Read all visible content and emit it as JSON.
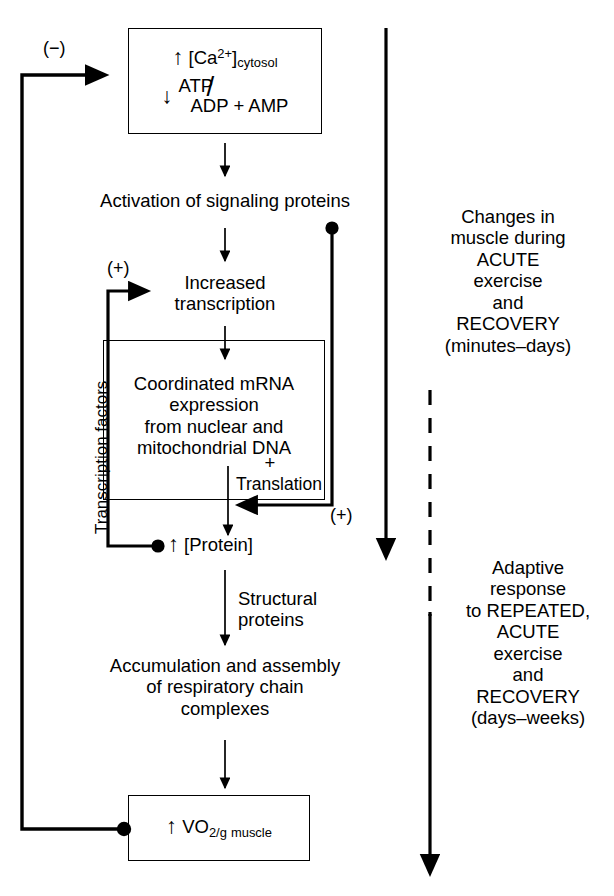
{
  "diagram": {
    "stroke_color": "#000000",
    "background": "#ffffff"
  },
  "nodes": {
    "stimulus_box": {
      "line1_arrow": "↑",
      "line1_species": "[Ca",
      "line1_charge": "2+",
      "line1_close": "]",
      "line1_subscript": "cytosol",
      "line2_arrow": "↓",
      "line2_numerator": "ATP",
      "line2_denominator": "ADP + AMP",
      "line2_slash": "/"
    },
    "activation": "Activation of signaling proteins",
    "increased_transcription": "Increased\ntranscription",
    "increased_transcription_l1": "Increased",
    "increased_transcription_l2": "transcription",
    "mrna_box_l1": "Coordinated mRNA",
    "mrna_box_l2": "expression",
    "mrna_box_l3": "from nuclear and",
    "mrna_box_l4": "mitochondrial DNA",
    "translation_plus": "+",
    "translation_label": "Translation",
    "protein": {
      "arrow": "↑",
      "label": "[Protein]"
    },
    "structural_proteins_l1": "Structural",
    "structural_proteins_l2": "proteins",
    "accumulation_l1": "Accumulation and assembly",
    "accumulation_l2": "of respiratory chain",
    "accumulation_l3": "complexes",
    "vo2_box": {
      "arrow": "↑",
      "label": "VO",
      "subscript": "2/g",
      "unit": "muscle"
    },
    "transcription_factors_label": "Transcription factors"
  },
  "signs": {
    "negative_feedback": "(−)",
    "positive_transcription": "(+)",
    "positive_translation": "(+)"
  },
  "right_column": {
    "acute": {
      "l1": "Changes in",
      "l2": "muscle during",
      "l3": "ACUTE",
      "l4": "exercise",
      "l5": "and",
      "l6": "RECOVERY",
      "l7": "(minutes–days)"
    },
    "adaptive": {
      "l1": "Adaptive",
      "l2": "response",
      "l3": "to REPEATED,",
      "l4": "ACUTE",
      "l5": "exercise",
      "l6": "and",
      "l7": "RECOVERY",
      "l8": "(days–weeks)"
    }
  }
}
